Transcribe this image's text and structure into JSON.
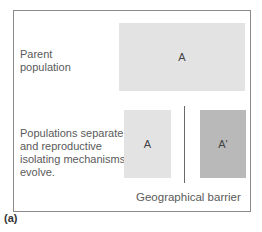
{
  "stage1": {
    "label": "Parent\npopulation",
    "label_lines": [
      "Parent",
      "population"
    ],
    "population": "A"
  },
  "stage2": {
    "label_lines": [
      "Populations separate",
      "and reproductive",
      "isolating mechanisms",
      "evolve."
    ],
    "left_population": "A",
    "right_population": "A'",
    "barrier_label": "Geographical barrier"
  },
  "panel_label": "(a)",
  "colors": {
    "parent_fill": "#e3e3e3",
    "left_fill": "#e3e3e3",
    "right_fill": "#b9b9b9",
    "frame": "#8a8a8a"
  }
}
